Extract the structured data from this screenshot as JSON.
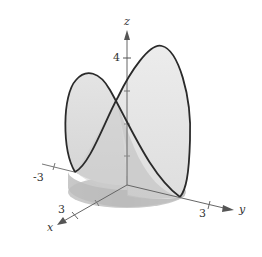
{
  "figure": {
    "type": "3d-surface-curve",
    "axes": {
      "x": {
        "label": "x",
        "tick_label": "3"
      },
      "y": {
        "label": "y",
        "tick_label": "3"
      },
      "z": {
        "label": "z",
        "tick_label": "4"
      },
      "neg_y_tick_label": "-3"
    },
    "colors": {
      "curve": "#2a2a2a",
      "axis": "#666666",
      "surface_light": "#e6e6e6",
      "surface_mid": "#cfcfcf",
      "surface_dark": "#b5b5b5"
    }
  }
}
